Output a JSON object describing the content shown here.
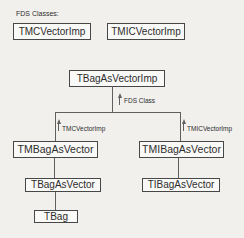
{
  "diagram": {
    "title": "FDS Classes:",
    "nodes": {
      "tmcvectorimp": "TMCVectorImp",
      "tmicvectorimp": "TMICVectorImp",
      "tbagasvectorimp": "TBagAsVectorImp",
      "tmbagasvector": "TMBagAsVector",
      "tmibagasvector": "TMIBagAsVector",
      "tbagasvector": "TBagAsVector",
      "tibagasvector": "TIBagAsVector",
      "tbag": "TBag"
    },
    "edge_labels": {
      "fds_class": "FDS Class",
      "tmcvectorimp": "TMCVectorImp",
      "tmicvectorimp": "TMICVectorImp"
    },
    "edges": [
      {
        "from": "tmbagasvector",
        "to": "tbagasvectorimp",
        "label": "FDS Class",
        "arrow": "up"
      },
      {
        "from": "tmibagasvector",
        "to": "tbagasvectorimp",
        "label": "FDS Class",
        "arrow": "up"
      },
      {
        "from": "tmbagasvector",
        "label": "TMCVectorImp",
        "arrow": "up"
      },
      {
        "from": "tmibagasvector",
        "label": "TMICVectorImp",
        "arrow": "up"
      },
      {
        "from": "tbagasvector",
        "to": "tmbagasvector"
      },
      {
        "from": "tibagasvector",
        "to": "tmibagasvector"
      },
      {
        "from": "tbag",
        "to": "tbagasvector"
      }
    ],
    "colors": {
      "background": "#f1f0ed",
      "box_fill": "#f9f9f7",
      "box_border": "#474747",
      "line": "#5f5f5f",
      "text": "#2d2d2d"
    }
  }
}
